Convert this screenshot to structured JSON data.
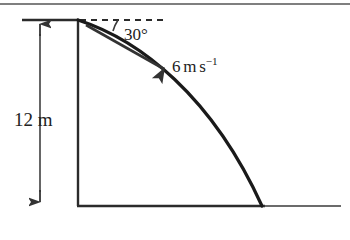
{
  "diagram": {
    "type": "projectile-motion-diagram",
    "background_color": "#ffffff",
    "stroke_color": "#222222",
    "labels": {
      "height": "12 m",
      "height_value": 12,
      "height_unit": "m",
      "angle": "30°",
      "angle_value": 30,
      "angle_unit": "degrees",
      "speed_number": "6",
      "speed_unit_m": "m",
      "speed_unit_s": "s",
      "speed_exponent": "−1",
      "speed_full": "6 m s⁻¹",
      "speed_value": 6
    },
    "geometry": {
      "launch_point": [
        78,
        20
      ],
      "landing_point": [
        262,
        206
      ],
      "wall_top": [
        78,
        20
      ],
      "wall_bottom": [
        78,
        206
      ],
      "ground_left": [
        78,
        206
      ],
      "ground_right": [
        340,
        206
      ],
      "dashed_line_start": [
        80,
        20
      ],
      "dashed_line_end": [
        163,
        20
      ],
      "dimension_line_x": 40,
      "dimension_top_y": 20,
      "dimension_bottom_y": 206,
      "velocity_arrow_start": [
        88,
        26
      ],
      "velocity_arrow_end": [
        168,
        72
      ],
      "top_border_y": 4,
      "ceiling_tick_start": [
        22,
        20
      ],
      "ceiling_tick_end": [
        78,
        20
      ]
    }
  }
}
